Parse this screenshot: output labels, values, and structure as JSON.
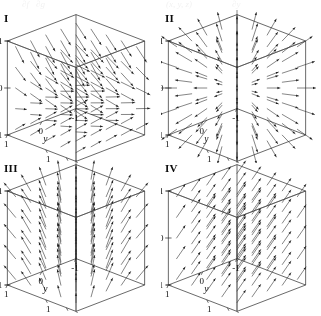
{
  "figure": {
    "type": "vector-field-panel-grid",
    "top_remnant": [
      {
        "text": "∂f",
        "x": 22
      },
      {
        "text": "∂g",
        "x": 36
      },
      {
        "text": "(x, y, z)",
        "x": 166
      },
      {
        "text": "∂y",
        "x": 232
      }
    ],
    "panels": [
      {
        "label": "I",
        "name": "panel-i",
        "field": "swirl",
        "description": "vectors sweeping from lower left upward to the right, fanning across the cube",
        "axes": {
          "x": {
            "label": "x",
            "ticks": [
              "1",
              "0",
              "-1"
            ]
          },
          "y": {
            "label": "y",
            "ticks": [
              "-1",
              "0",
              "1"
            ]
          },
          "z": {
            "label": "z",
            "ticks": [
              "1",
              "0",
              "-1"
            ]
          }
        }
      },
      {
        "label": "II",
        "name": "panel-ii",
        "field": "radial",
        "description": "vectors radiating outward from the center of the cube in all directions",
        "axes": {
          "x": {
            "label": "x",
            "ticks": [
              "1",
              "0",
              "-1"
            ]
          },
          "y": {
            "label": "y",
            "ticks": [
              "-1",
              "0",
              "1"
            ]
          },
          "z": {
            "label": "z",
            "ticks": [
              "1",
              "0",
              "-1"
            ]
          }
        }
      },
      {
        "label": "III",
        "name": "panel-iii",
        "field": "vertical-fan",
        "description": "vectors pointing upward and fanning outward from a vertical axis",
        "axes": {
          "x": {
            "label": "x",
            "ticks": [
              "1",
              "0",
              "-1"
            ]
          },
          "y": {
            "label": "y",
            "ticks": [
              "-1",
              "0",
              "1"
            ]
          },
          "z": {
            "label": "z",
            "ticks": [
              "1",
              "-1"
            ]
          }
        }
      },
      {
        "label": "IV",
        "name": "panel-iv",
        "field": "uniform",
        "description": "uniform parallel vectors all pointing up and to the right",
        "axes": {
          "x": {
            "label": "x",
            "ticks": [
              "1",
              "0",
              "-1"
            ]
          },
          "y": {
            "label": "y",
            "ticks": [
              "-1",
              "0",
              "1"
            ]
          },
          "z": {
            "label": "z",
            "ticks": [
              "1",
              "0",
              "-1"
            ]
          }
        }
      }
    ]
  },
  "chart_data": {
    "type": "scatter",
    "title": "",
    "xlabel": "x",
    "ylabel": "y",
    "zlabel": "z",
    "xlim": [
      -1,
      1
    ],
    "ylim": [
      -1,
      1
    ],
    "zlim": [
      -1,
      1
    ],
    "grid": false,
    "legend": "none",
    "panels": [
      {
        "id": "I",
        "field_type": "swirl",
        "xtick_labels": [
          "1",
          "0",
          "-1"
        ],
        "ytick_labels": [
          "-1",
          "0",
          "1"
        ],
        "ztick_labels": [
          "1",
          "0",
          "-1"
        ]
      },
      {
        "id": "II",
        "field_type": "radial-outward",
        "xtick_labels": [
          "1",
          "0",
          "-1"
        ],
        "ytick_labels": [
          "-1",
          "0",
          "1"
        ],
        "ztick_labels": [
          "1",
          "0",
          "-1"
        ]
      },
      {
        "id": "III",
        "field_type": "vertical-fan",
        "xtick_labels": [
          "1",
          "0",
          "-1"
        ],
        "ytick_labels": [
          "-1",
          "0",
          "1"
        ],
        "ztick_labels": [
          "1",
          "-1"
        ]
      },
      {
        "id": "IV",
        "field_type": "uniform-parallel",
        "xtick_labels": [
          "1",
          "0",
          "-1"
        ],
        "ytick_labels": [
          "-1",
          "0",
          "1"
        ],
        "ztick_labels": [
          "1",
          "0",
          "-1"
        ]
      }
    ]
  }
}
